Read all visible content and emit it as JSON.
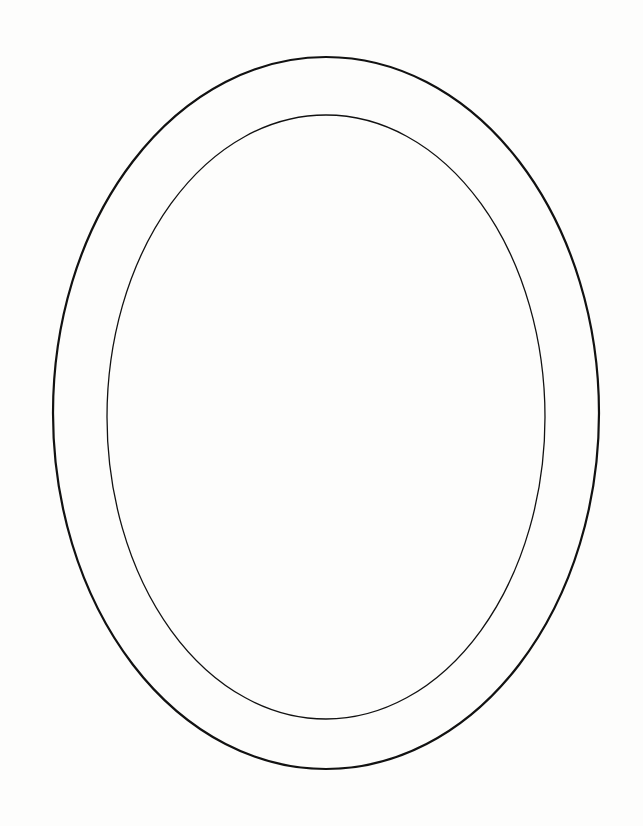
{
  "diagram": {
    "title": "",
    "background": "#fdfdfc",
    "shapes": [
      {
        "id": "outer-ellipse",
        "type": "ellipse",
        "cx": 326,
        "cy": 413,
        "rx": 273,
        "ry": 356,
        "stroke": "#111111",
        "stroke_width": 2.2,
        "fill": "none"
      },
      {
        "id": "inner-ellipse",
        "type": "ellipse",
        "cx": 326,
        "cy": 417,
        "rx": 219,
        "ry": 302,
        "stroke": "#111111",
        "stroke_width": 1.3,
        "fill": "none"
      }
    ]
  }
}
